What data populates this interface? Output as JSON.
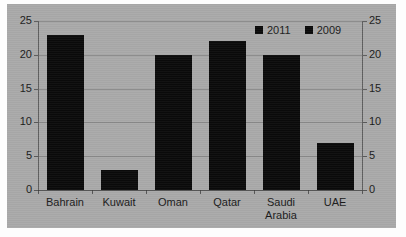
{
  "chart_data": {
    "type": "bar",
    "title": "",
    "subtitle": "",
    "xlabel": "",
    "ylabel": "",
    "categories": [
      "Bahrain",
      "Kuwait",
      "Oman",
      "Qatar",
      "Saudi Arabia",
      "UAE"
    ],
    "category_lines": [
      [
        "Bahrain"
      ],
      [
        "Kuwait"
      ],
      [
        "Oman"
      ],
      [
        "Qatar"
      ],
      [
        "Saudi",
        "Arabia"
      ],
      [
        "UAE"
      ]
    ],
    "series": [
      {
        "name": "2009",
        "values": [
          23,
          3,
          20,
          22,
          20,
          7
        ],
        "color": "#0a0a0a"
      }
    ],
    "legend": {
      "position": "top-right",
      "entries": [
        {
          "label": "2011",
          "marker": "square",
          "color": "#0a0a0a"
        },
        {
          "label": "2009",
          "marker": "square",
          "color": "#0a0a0a"
        }
      ]
    },
    "axes": {
      "left": {
        "ylim": [
          0,
          25
        ],
        "ticks": [
          25,
          20,
          15,
          10,
          5,
          0
        ],
        "tick_labels": [
          "25",
          "20",
          "15",
          "10",
          "5",
          "0"
        ]
      },
      "right": {
        "ylim": [
          0,
          25
        ],
        "ticks": [
          25,
          20,
          15,
          10,
          5,
          0
        ],
        "tick_labels": [
          "25",
          "20",
          "15",
          "10",
          "5",
          "0"
        ]
      }
    },
    "grid": {
      "horizontal": true,
      "vertical": false
    },
    "style": {
      "plot_background": "#a9a9a9",
      "page_background": "#fdfdfd",
      "bar_color": "#0a0a0a",
      "axis_color": "#4a4a4a",
      "text_color": "#1a1a1a"
    }
  }
}
